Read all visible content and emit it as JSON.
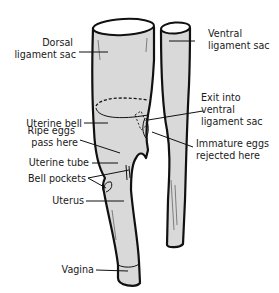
{
  "diagram": {
    "labels": {
      "dorsal_ligament_sac": [
        "Dorsal",
        "ligament sac"
      ],
      "ventral_ligament_sac": [
        "Ventral",
        "ligament sac"
      ],
      "uterine_bell": [
        "Uterine bell"
      ],
      "exit_into_ventral": [
        "Exit into",
        "ventral",
        "ligament sac"
      ],
      "ripe_eggs": [
        "Ripe eggs",
        "pass here"
      ],
      "immature_eggs": [
        "Immature eggs",
        "rejected here"
      ],
      "uterine_tube": [
        "Uterine tube"
      ],
      "bell_pockets": [
        "Bell pockets"
      ],
      "uterus": [
        "Uterus"
      ],
      "vagina": [
        "Vagina"
      ]
    },
    "colors": {
      "fill": "#d9d9d9",
      "outline": "#111111",
      "background": "#ffffff"
    }
  }
}
